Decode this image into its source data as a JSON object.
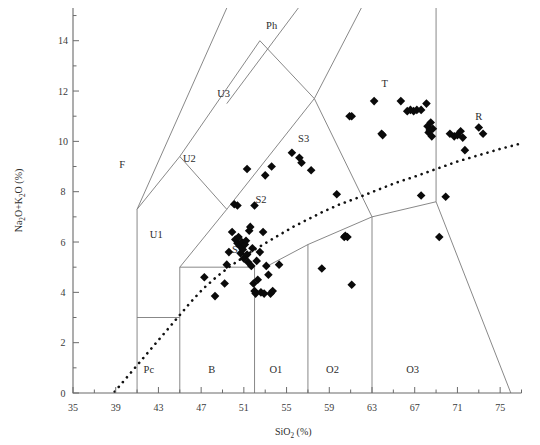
{
  "chart_data": {
    "type": "scatter",
    "title": "",
    "xlabel": "SiO2 (%)",
    "xlabel_parts": {
      "pre": "SiO",
      "sub": "2",
      "post": " (%)"
    },
    "ylabel": "Na2O+K2O (%)",
    "ylabel_parts": {
      "a": "Na",
      "a_sub": "2",
      "b": "O+K",
      "b_sub": "2",
      "c": "O (%)"
    },
    "xlim": [
      35,
      77
    ],
    "ylim": [
      0,
      15.3
    ],
    "xticks": [
      35,
      39,
      43,
      47,
      51,
      55,
      59,
      63,
      67,
      71,
      75
    ],
    "xticklabels": [
      "35",
      "39",
      "43",
      "47",
      "51",
      "55",
      "59",
      "63",
      "67",
      "71",
      "75"
    ],
    "xminorticks": [
      37,
      41,
      45,
      49,
      53,
      57,
      61,
      65,
      69,
      73,
      77
    ],
    "yticks": [
      0,
      2,
      4,
      6,
      8,
      10,
      12,
      14
    ],
    "yticklabels": [
      "0",
      "2",
      "4",
      "6",
      "8",
      "10",
      "12",
      "14"
    ],
    "yminorticks": [
      1,
      3,
      5,
      7,
      9,
      11,
      13,
      15
    ],
    "grid": false,
    "legend": "none",
    "marker_style": "filled-diamond",
    "marker_color": "#0a0a0a",
    "field_labels": [
      {
        "name": "F",
        "x": 39.6,
        "y": 9.1
      },
      {
        "name": "U1",
        "x": 42.8,
        "y": 6.3
      },
      {
        "name": "U2",
        "x": 45.9,
        "y": 9.3
      },
      {
        "name": "U3",
        "x": 49.1,
        "y": 11.9
      },
      {
        "name": "Ph",
        "x": 53.6,
        "y": 14.6
      },
      {
        "name": "Pc",
        "x": 42.1,
        "y": 0.95
      },
      {
        "name": "B",
        "x": 48.0,
        "y": 0.95
      },
      {
        "name": "S1",
        "x": 50.4,
        "y": 5.7
      },
      {
        "name": "S2",
        "x": 52.6,
        "y": 7.7
      },
      {
        "name": "S3",
        "x": 56.6,
        "y": 10.1
      },
      {
        "name": "T",
        "x": 64.2,
        "y": 12.3
      },
      {
        "name": "R",
        "x": 73.0,
        "y": 11.0
      },
      {
        "name": "O1",
        "x": 54.0,
        "y": 0.95
      },
      {
        "name": "O2",
        "x": 59.3,
        "y": 0.95
      },
      {
        "name": "O3",
        "x": 66.8,
        "y": 0.95
      }
    ],
    "field_boundaries": [
      {
        "name": "pc-b-vertical",
        "points": [
          [
            41.0,
            0.0
          ],
          [
            41.0,
            7.3
          ]
        ]
      },
      {
        "name": "pc-top",
        "points": [
          [
            41.0,
            3.0
          ],
          [
            45.0,
            3.0
          ]
        ]
      },
      {
        "name": "b-s1-vertical",
        "points": [
          [
            45.0,
            0.0
          ],
          [
            45.0,
            5.0
          ]
        ]
      },
      {
        "name": "b-s1-horizontal",
        "points": [
          [
            45.0,
            5.0
          ],
          [
            52.0,
            5.0
          ]
        ]
      },
      {
        "name": "o1-vertical",
        "points": [
          [
            52.0,
            0.0
          ],
          [
            52.0,
            5.0
          ]
        ]
      },
      {
        "name": "s1-s2-upper",
        "points": [
          [
            45.0,
            5.0
          ],
          [
            49.4,
            7.3
          ]
        ]
      },
      {
        "name": "u1-apex",
        "points": [
          [
            41.0,
            7.3
          ],
          [
            45.0,
            9.4
          ]
        ]
      },
      {
        "name": "u1-u2-left",
        "points": [
          [
            45.0,
            9.4
          ],
          [
            49.4,
            7.3
          ]
        ]
      },
      {
        "name": "f-left-diag",
        "points": [
          [
            41.0,
            7.3
          ],
          [
            49.4,
            15.3
          ]
        ]
      },
      {
        "name": "u2-u3-diag",
        "points": [
          [
            45.0,
            9.4
          ],
          [
            52.5,
            14.0
          ]
        ]
      },
      {
        "name": "u3-ph-diag",
        "points": [
          [
            49.4,
            11.5
          ],
          [
            56.1,
            15.3
          ]
        ]
      },
      {
        "name": "s2-s3-diag",
        "points": [
          [
            49.4,
            7.3
          ],
          [
            57.6,
            11.7
          ]
        ]
      },
      {
        "name": "u3-s3-diag",
        "points": [
          [
            52.5,
            14.0
          ],
          [
            57.6,
            11.7
          ]
        ]
      },
      {
        "name": "ph-t-diag",
        "points": [
          [
            57.6,
            11.7
          ],
          [
            62.0,
            15.3
          ]
        ]
      },
      {
        "name": "s3-t-diag",
        "points": [
          [
            57.6,
            11.7
          ],
          [
            63.0,
            7.0
          ]
        ]
      },
      {
        "name": "o2-s3-step",
        "points": [
          [
            53.0,
            5.0
          ],
          [
            57.0,
            5.9
          ]
        ]
      },
      {
        "name": "o2-vertical",
        "points": [
          [
            57.0,
            0.0
          ],
          [
            57.0,
            5.9
          ]
        ]
      },
      {
        "name": "s3-o2-up",
        "points": [
          [
            57.0,
            5.9
          ],
          [
            63.0,
            7.0
          ]
        ]
      },
      {
        "name": "o3-vertical",
        "points": [
          [
            63.0,
            0.0
          ],
          [
            63.0,
            7.0
          ]
        ]
      },
      {
        "name": "t-vertical",
        "points": [
          [
            69.0,
            7.6
          ],
          [
            69.0,
            15.3
          ]
        ]
      },
      {
        "name": "t-o3-join",
        "points": [
          [
            63.0,
            7.0
          ],
          [
            69.0,
            7.6
          ]
        ]
      },
      {
        "name": "r-o3-diag",
        "points": [
          [
            69.0,
            7.6
          ],
          [
            76.0,
            0.0
          ]
        ]
      }
    ],
    "divider_curve": {
      "name": "alkaline-subalkaline-divider",
      "style": "dotted",
      "points": [
        [
          38.9,
          0.05
        ],
        [
          40.0,
          0.6
        ],
        [
          41.2,
          1.2
        ],
        [
          42.4,
          1.8
        ],
        [
          43.6,
          2.4
        ],
        [
          44.8,
          3.0
        ],
        [
          46.0,
          3.6
        ],
        [
          47.2,
          4.15
        ],
        [
          48.4,
          4.6
        ],
        [
          49.6,
          5.0
        ],
        [
          50.8,
          5.35
        ],
        [
          52.0,
          5.7
        ],
        [
          53.2,
          6.0
        ],
        [
          54.4,
          6.3
        ],
        [
          55.6,
          6.6
        ],
        [
          57.0,
          6.9
        ],
        [
          58.4,
          7.2
        ],
        [
          60.0,
          7.5
        ],
        [
          61.6,
          7.75
        ],
        [
          63.4,
          8.05
        ],
        [
          65.2,
          8.35
        ],
        [
          67.0,
          8.6
        ],
        [
          69.0,
          8.9
        ],
        [
          71.0,
          9.2
        ],
        [
          73.0,
          9.45
        ],
        [
          75.0,
          9.7
        ],
        [
          76.8,
          9.9
        ]
      ]
    },
    "points": [
      [
        47.3,
        4.6
      ],
      [
        48.3,
        3.85
      ],
      [
        49.2,
        4.35
      ],
      [
        49.4,
        5.1
      ],
      [
        49.6,
        5.6
      ],
      [
        49.9,
        6.4
      ],
      [
        50.2,
        6.1
      ],
      [
        50.4,
        5.95
      ],
      [
        50.5,
        6.2
      ],
      [
        50.6,
        5.85
      ],
      [
        50.7,
        5.55
      ],
      [
        50.8,
        6.0
      ],
      [
        50.9,
        5.7
      ],
      [
        51.0,
        5.35
      ],
      [
        51.1,
        5.9
      ],
      [
        51.2,
        6.05
      ],
      [
        51.3,
        5.5
      ],
      [
        51.4,
        5.2
      ],
      [
        51.5,
        6.45
      ],
      [
        51.6,
        6.6
      ],
      [
        51.7,
        5.05
      ],
      [
        51.8,
        5.75
      ],
      [
        51.9,
        4.35
      ],
      [
        52.0,
        4.05
      ],
      [
        52.1,
        3.95
      ],
      [
        52.2,
        5.25
      ],
      [
        52.3,
        4.5
      ],
      [
        52.5,
        5.6
      ],
      [
        52.6,
        4.0
      ],
      [
        52.8,
        6.4
      ],
      [
        52.9,
        3.95
      ],
      [
        53.1,
        5.05
      ],
      [
        53.3,
        4.7
      ],
      [
        53.5,
        3.95
      ],
      [
        53.7,
        4.05
      ],
      [
        50.1,
        7.5
      ],
      [
        50.4,
        7.45
      ],
      [
        51.3,
        8.9
      ],
      [
        52.0,
        7.45
      ],
      [
        53.0,
        8.65
      ],
      [
        53.6,
        9.0
      ],
      [
        54.3,
        5.1
      ],
      [
        55.5,
        9.55
      ],
      [
        56.2,
        9.35
      ],
      [
        56.4,
        9.15
      ],
      [
        57.3,
        8.85
      ],
      [
        59.7,
        7.9
      ],
      [
        60.4,
        6.2
      ],
      [
        60.5,
        6.25
      ],
      [
        60.7,
        6.2
      ],
      [
        61.1,
        4.3
      ],
      [
        63.2,
        11.6
      ],
      [
        63.9,
        10.3
      ],
      [
        64.0,
        10.25
      ],
      [
        65.7,
        11.6
      ],
      [
        66.3,
        11.2
      ],
      [
        66.6,
        11.25
      ],
      [
        66.9,
        11.2
      ],
      [
        67.2,
        11.25
      ],
      [
        67.6,
        11.25
      ],
      [
        68.1,
        11.5
      ],
      [
        68.2,
        10.6
      ],
      [
        68.3,
        10.35
      ],
      [
        68.4,
        10.45
      ],
      [
        68.5,
        10.75
      ],
      [
        68.6,
        10.2
      ],
      [
        68.7,
        10.5
      ],
      [
        69.3,
        6.2
      ],
      [
        70.3,
        10.3
      ],
      [
        70.7,
        10.2
      ],
      [
        71.0,
        10.25
      ],
      [
        71.3,
        10.4
      ],
      [
        71.5,
        10.15
      ],
      [
        71.7,
        9.65
      ],
      [
        73.0,
        10.55
      ],
      [
        73.4,
        10.3
      ],
      [
        69.9,
        7.8
      ],
      [
        67.6,
        7.85
      ],
      [
        60.9,
        11.0
      ],
      [
        61.1,
        11.0
      ],
      [
        58.3,
        4.95
      ]
    ]
  },
  "axis": {
    "x_title_pre": "SiO",
    "x_title_sub": "2",
    "x_title_post": " (%)",
    "y_title_a": "Na",
    "y_title_a_sub": "2",
    "y_title_b": "O+K",
    "y_title_b_sub": "2",
    "y_title_c": "O (%)"
  }
}
